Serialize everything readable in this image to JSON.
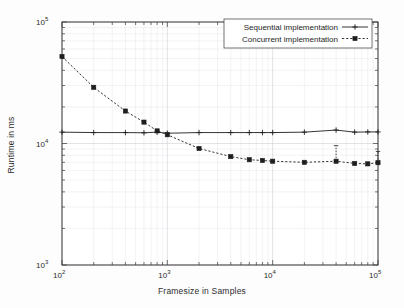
{
  "chart_data": {
    "type": "line",
    "title": "",
    "xlabel": "Framesize in Samples",
    "ylabel": "Runtime in ms",
    "xscale": "log",
    "yscale": "log",
    "xlim": [
      100,
      100000
    ],
    "ylim": [
      1000,
      100000
    ],
    "grid": true,
    "legend_position": "top-right",
    "xtick_labels": [
      "10",
      "10",
      "10",
      "10"
    ],
    "xtick_exponents": [
      "2",
      "3",
      "4",
      "5"
    ],
    "xtick_values": [
      100,
      1000,
      10000,
      100000
    ],
    "ytick_labels": [
      "10",
      "10",
      "10"
    ],
    "ytick_exponents": [
      "3",
      "4",
      "5"
    ],
    "ytick_values": [
      1000,
      10000,
      100000
    ],
    "series": [
      {
        "name": "Sequential implementation",
        "line_style": "solid",
        "marker": "plus",
        "color": "#1e1e1e",
        "x": [
          100,
          200,
          400,
          600,
          800,
          1000,
          2000,
          4000,
          6000,
          8000,
          10000,
          20000,
          40000,
          60000,
          80000,
          100000
        ],
        "y": [
          12400,
          12300,
          12300,
          12250,
          12400,
          12150,
          12300,
          12300,
          12300,
          12300,
          12300,
          12400,
          12900,
          12400,
          12450,
          12450
        ]
      },
      {
        "name": "Concurrent implementation",
        "line_style": "dashed",
        "marker": "square",
        "color": "#1e1e1e",
        "x": [
          100,
          200,
          400,
          600,
          800,
          1000,
          2000,
          4000,
          6000,
          8000,
          10000,
          20000,
          40000,
          60000,
          80000,
          100000
        ],
        "y": [
          52000,
          29000,
          18500,
          15000,
          12700,
          11800,
          9100,
          7800,
          7350,
          7250,
          7150,
          7000,
          7150,
          6850,
          6800,
          6950
        ],
        "error_bars": [
          {
            "x": 40000,
            "ylow": 7150,
            "yhigh": 9600
          },
          {
            "x": 100000,
            "ylow": 6950,
            "yhigh": 8600
          }
        ]
      }
    ],
    "legend_entries": [
      {
        "label": "Sequential implementation",
        "line_style": "solid",
        "marker": "plus"
      },
      {
        "label": "Concurrent implementation",
        "line_style": "dashed",
        "marker": "square"
      }
    ]
  }
}
